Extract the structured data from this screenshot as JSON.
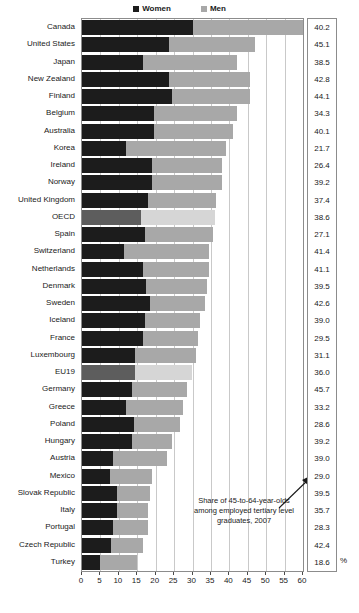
{
  "legend": {
    "entries": [
      {
        "label": "Women",
        "color": "#1c1c1c",
        "icon": "square-swatch-icon"
      },
      {
        "label": "Men",
        "color": "#a8a8a8",
        "icon": "square-swatch-icon"
      }
    ]
  },
  "annotation": {
    "line1": "Share of 45-to-64-year-olds",
    "line2": "among employed tertiary level",
    "line3": "graduates, 2007"
  },
  "axis": {
    "percent_symbol": "%",
    "ticks": [
      "0",
      "5",
      "10",
      "15",
      "20",
      "25",
      "30",
      "35",
      "40",
      "45",
      "50",
      "55",
      "60"
    ]
  },
  "chart_data": {
    "type": "bar",
    "orientation": "horizontal",
    "stacked": true,
    "title": "",
    "subtitle": "Share of 45-to-64-year-olds among employed tertiary level graduates, 2007",
    "xlabel": "%",
    "ylabel": "",
    "xlim": [
      0,
      60
    ],
    "xticks": [
      0,
      5,
      10,
      15,
      20,
      25,
      30,
      35,
      40,
      45,
      50,
      55,
      60
    ],
    "grid": true,
    "legend_position": "top-center",
    "categories": [
      "Canada",
      "United States",
      "Japan",
      "New Zealand",
      "Finland",
      "Belgium",
      "Australia",
      "Korea",
      "Ireland",
      "Norway",
      "United Kingdom",
      "OECD",
      "Spain",
      "Switzerland",
      "Netherlands",
      "Denmark",
      "Sweden",
      "Iceland",
      "France",
      "Luxembourg",
      "EU19",
      "Germany",
      "Greece",
      "Poland",
      "Hungary",
      "Austria",
      "Mexico",
      "Slovak Republic",
      "Italy",
      "Portugal",
      "Czech Republic",
      "Turkey"
    ],
    "highlighted_categories": [
      "OECD",
      "EU19"
    ],
    "series": [
      {
        "name": "Women",
        "color": "#1c1c1c",
        "values": [
          30.0,
          23.5,
          16.5,
          23.5,
          24.5,
          19.5,
          19.5,
          12.0,
          19.0,
          19.0,
          18.0,
          16.0,
          17.0,
          11.5,
          16.5,
          17.5,
          18.5,
          17.0,
          16.5,
          14.5,
          14.5,
          13.5,
          12.0,
          14.0,
          13.5,
          8.5,
          7.5,
          9.5,
          9.5,
          8.5,
          8.0,
          5.0
        ]
      },
      {
        "name": "Men",
        "color": "#a8a8a8",
        "values": [
          30.0,
          23.5,
          25.5,
          22.0,
          21.0,
          22.5,
          21.5,
          27.0,
          19.0,
          19.0,
          18.5,
          20.0,
          18.5,
          23.0,
          18.0,
          16.5,
          15.0,
          15.0,
          15.0,
          16.5,
          15.5,
          15.0,
          15.5,
          12.5,
          11.0,
          14.5,
          11.5,
          9.0,
          8.5,
          9.5,
          8.5,
          10.0
        ]
      }
    ],
    "value_column": {
      "header": "",
      "values": [
        "40.2",
        "45.1",
        "38.5",
        "42.8",
        "44.1",
        "34.3",
        "40.1",
        "21.7",
        "26.4",
        "39.2",
        "37.4",
        "38.6",
        "27.1",
        "41.4",
        "41.1",
        "39.5",
        "42.6",
        "39.0",
        "29.5",
        "31.1",
        "36.0",
        "45.7",
        "33.2",
        "28.6",
        "39.2",
        "39.0",
        "29.0",
        "39.5",
        "35.7",
        "28.3",
        "42.4",
        "18.6"
      ]
    }
  }
}
